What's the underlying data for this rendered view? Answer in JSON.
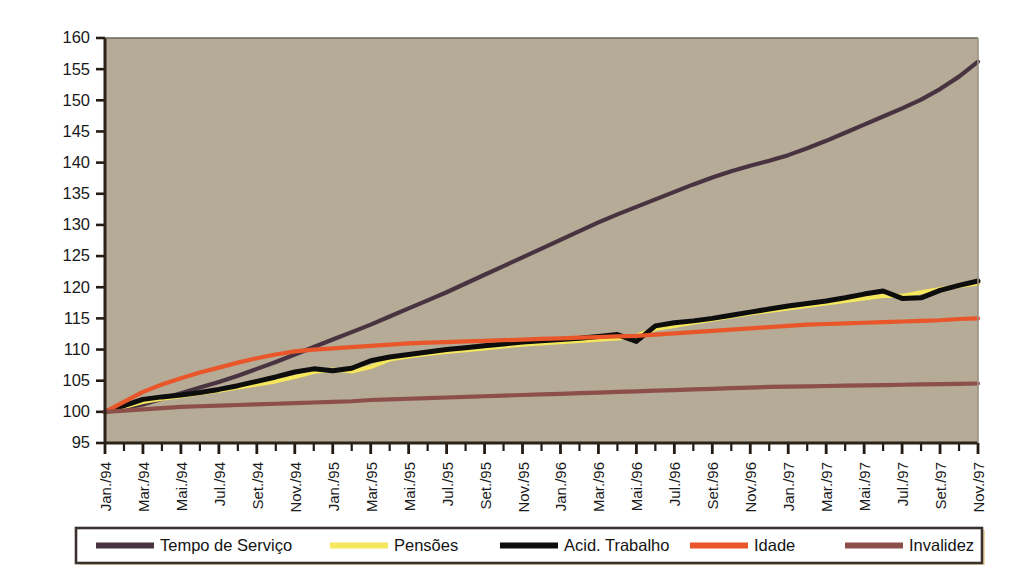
{
  "chart_data": {
    "type": "line",
    "title": "",
    "subtitle": "",
    "xlabel": "",
    "ylabel": "",
    "ylim": [
      95,
      160
    ],
    "ytick_step": 5,
    "ytick_labels": [
      "160",
      "155",
      "150",
      "145",
      "140",
      "135",
      "130",
      "125",
      "120",
      "115",
      "110",
      "105",
      "100",
      "95"
    ],
    "ytick_values": [
      160,
      155,
      150,
      145,
      140,
      135,
      130,
      125,
      120,
      115,
      110,
      105,
      100,
      95
    ],
    "grid": false,
    "legend_position": "bottom",
    "plot_background": "#b5ab97",
    "plot_border_color": "#5b5348",
    "x_label_rotation": -90,
    "x_tick_interval_months": 1,
    "x_label_interval_months": 2,
    "x": [
      "Jan./94",
      "Fev./94",
      "Mar./94",
      "Abr./94",
      "Mai./94",
      "Jun./94",
      "Jul./94",
      "Ago./94",
      "Set./94",
      "Out./94",
      "Nov./94",
      "Dez./94",
      "Jan./95",
      "Fev./95",
      "Mar./95",
      "Abr./95",
      "Mai./95",
      "Jun./95",
      "Jul./95",
      "Ago./95",
      "Set./95",
      "Out./95",
      "Nov./95",
      "Dez./95",
      "Jan./96",
      "Fev./96",
      "Mar./96",
      "Abr./96",
      "Mai./96",
      "Jun./96",
      "Jul./96",
      "Ago./96",
      "Set./96",
      "Out./96",
      "Nov./96",
      "Dez./96",
      "Jan./97",
      "Fev./97",
      "Mar./97",
      "Abr./97",
      "Mai./97",
      "Jun./97",
      "Jul./97",
      "Ago./97",
      "Set./97",
      "Out./97",
      "Nov./97"
    ],
    "xtick_labels": [
      "Jan./94",
      "Mar./94",
      "Mai./94",
      "Jul./94",
      "Set./94",
      "Nov./94",
      "Jan./95",
      "Mar./95",
      "Mai./95",
      "Jul./95",
      "Set./95",
      "Nov./95",
      "Jan./96",
      "Mar./96",
      "Mai./96",
      "Jul./96",
      "Set./96",
      "Nov./96",
      "Jan./97",
      "Mar./97",
      "Mai./97",
      "Jul./97",
      "Set./97",
      "Nov./97"
    ],
    "series": [
      {
        "name": "Tempo de Serviço",
        "color": "#4a3340",
        "width": 4.2,
        "values": [
          100.0,
          100.6,
          101.2,
          102.1,
          103.0,
          103.9,
          104.8,
          105.8,
          106.9,
          108.0,
          109.2,
          110.4,
          111.6,
          112.8,
          114.0,
          115.3,
          116.6,
          117.9,
          119.2,
          120.6,
          122.0,
          123.4,
          124.8,
          126.2,
          127.6,
          129.0,
          130.4,
          131.7,
          132.9,
          134.1,
          135.3,
          136.5,
          137.6,
          138.6,
          139.5,
          140.3,
          141.2,
          142.3,
          143.5,
          144.8,
          146.1,
          147.4,
          148.7,
          150.1,
          151.8,
          153.8,
          156.2
        ]
      },
      {
        "name": "Pensões",
        "color": "#f5e85c",
        "width": 4.2,
        "values": [
          100.0,
          100.8,
          101.6,
          102.1,
          102.5,
          103.0,
          103.4,
          103.9,
          104.4,
          104.9,
          105.6,
          106.4,
          106.8,
          106.5,
          107.2,
          108.4,
          108.9,
          109.3,
          109.6,
          109.9,
          110.2,
          110.5,
          110.8,
          111.0,
          111.2,
          111.4,
          111.6,
          111.8,
          112.2,
          113.3,
          113.8,
          114.3,
          114.8,
          115.3,
          115.8,
          116.2,
          116.6,
          117.0,
          117.4,
          117.8,
          118.2,
          118.6,
          118.6,
          119.2,
          119.7,
          120.2,
          120.6
        ]
      },
      {
        "name": "Acid. Trabalho",
        "color": "#0d0d0d",
        "width": 5.0,
        "values": [
          100.0,
          101.0,
          102.0,
          102.4,
          102.7,
          103.1,
          103.6,
          104.2,
          104.9,
          105.6,
          106.4,
          106.9,
          106.6,
          107.0,
          108.2,
          108.8,
          109.2,
          109.6,
          110.0,
          110.3,
          110.6,
          110.9,
          111.2,
          111.4,
          111.6,
          111.8,
          112.1,
          112.4,
          111.3,
          113.8,
          114.3,
          114.6,
          115.0,
          115.5,
          116.0,
          116.5,
          117.0,
          117.4,
          117.8,
          118.3,
          118.9,
          119.4,
          118.2,
          118.3,
          119.5,
          120.3,
          121.0
        ]
      },
      {
        "name": "Idade",
        "color": "#e8562a",
        "width": 4.2,
        "values": [
          100.0,
          101.6,
          103.2,
          104.4,
          105.4,
          106.3,
          107.1,
          107.9,
          108.6,
          109.2,
          109.7,
          110.0,
          110.2,
          110.4,
          110.6,
          110.8,
          111.0,
          111.1,
          111.2,
          111.3,
          111.4,
          111.5,
          111.6,
          111.7,
          111.8,
          111.9,
          112.0,
          112.1,
          112.2,
          112.4,
          112.6,
          112.8,
          113.0,
          113.2,
          113.4,
          113.6,
          113.8,
          114.0,
          114.1,
          114.2,
          114.3,
          114.4,
          114.5,
          114.6,
          114.7,
          114.9,
          115.0
        ]
      },
      {
        "name": "Invalidez",
        "color": "#8d4f4a",
        "width": 4.2,
        "values": [
          100.0,
          100.2,
          100.4,
          100.6,
          100.8,
          100.9,
          101.0,
          101.1,
          101.2,
          101.3,
          101.4,
          101.5,
          101.6,
          101.7,
          101.9,
          102.0,
          102.1,
          102.2,
          102.3,
          102.4,
          102.5,
          102.6,
          102.7,
          102.8,
          102.9,
          103.0,
          103.1,
          103.2,
          103.3,
          103.4,
          103.5,
          103.6,
          103.7,
          103.8,
          103.9,
          104.0,
          104.05,
          104.1,
          104.15,
          104.2,
          104.25,
          104.3,
          104.35,
          104.4,
          104.45,
          104.5,
          104.55
        ]
      }
    ]
  },
  "legend": {
    "border_color": "#3a3230",
    "accent_color": "#f0d9a8",
    "background": "#ffffff",
    "items": [
      {
        "label": "Tempo de Serviço",
        "color": "#4a3340"
      },
      {
        "label": "Pensões",
        "color": "#f5e85c"
      },
      {
        "label": "Acid. Trabalho",
        "color": "#0d0d0d"
      },
      {
        "label": "Idade",
        "color": "#e8562a"
      },
      {
        "label": "Invalidez",
        "color": "#8d4f4a"
      }
    ]
  }
}
